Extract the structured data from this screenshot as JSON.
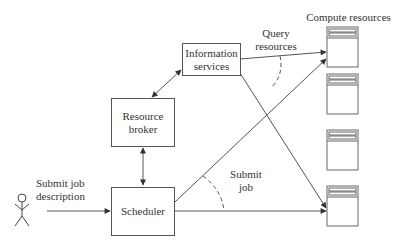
{
  "diagram": {
    "nodes": {
      "information_services": {
        "line1": "Information",
        "line2": "services"
      },
      "resource_broker": {
        "line1": "Resource",
        "line2": "broker"
      },
      "scheduler": {
        "label": "Scheduler"
      }
    },
    "labels": {
      "compute_resources": "Compute resources",
      "query_resources_1": "Query",
      "query_resources_2": "resources",
      "submit_job_1": "Submit",
      "submit_job_2": "job",
      "submit_job_description_1": "Submit job",
      "submit_job_description_2": "description"
    },
    "compute_resource_count": 4,
    "user_icon": "stick-figure-user"
  }
}
